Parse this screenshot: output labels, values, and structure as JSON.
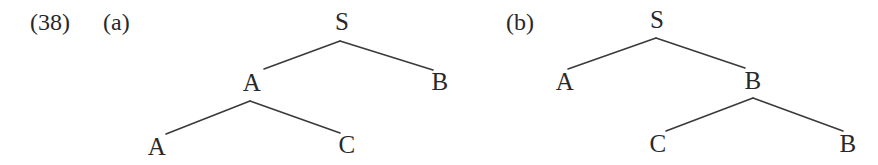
{
  "figure": {
    "example_number": "(38)",
    "example_number_pos": {
      "x": 30,
      "y": 10
    },
    "background_color": "#ffffff",
    "ink_color": "#28282b",
    "line_color": "#3a3a3a",
    "line_width": 1.6,
    "subfigures": [
      {
        "id": "a",
        "label": "(a)",
        "label_pos": {
          "x": 103,
          "y": 10
        },
        "nodes": [
          {
            "id": "a-root-s",
            "text": "S",
            "x": 342,
            "y": 21
          },
          {
            "id": "a-mid-a",
            "text": "A",
            "x": 252,
            "y": 82
          },
          {
            "id": "a-right-b",
            "text": "B",
            "x": 440,
            "y": 81
          },
          {
            "id": "a-leaf-a",
            "text": "A",
            "x": 157,
            "y": 146
          },
          {
            "id": "a-leaf-c",
            "text": "C",
            "x": 347,
            "y": 144
          }
        ],
        "edges": [
          {
            "from": "a-root-s",
            "to": "a-mid-a",
            "x1": 340,
            "y1": 41,
            "x2": 264,
            "y2": 69
          },
          {
            "from": "a-root-s",
            "to": "a-right-b",
            "x1": 340,
            "y1": 41,
            "x2": 433,
            "y2": 70
          },
          {
            "from": "a-mid-a",
            "to": "a-leaf-a",
            "x1": 250,
            "y1": 101,
            "x2": 166,
            "y2": 134
          },
          {
            "from": "a-mid-a",
            "to": "a-leaf-c",
            "x1": 250,
            "y1": 101,
            "x2": 340,
            "y2": 133
          }
        ]
      },
      {
        "id": "b",
        "label": "(b)",
        "label_pos": {
          "x": 506,
          "y": 10
        },
        "nodes": [
          {
            "id": "b-root-s",
            "text": "S",
            "x": 657,
            "y": 19
          },
          {
            "id": "b-left-a",
            "text": "A",
            "x": 565,
            "y": 81
          },
          {
            "id": "b-mid-b",
            "text": "B",
            "x": 753,
            "y": 80
          },
          {
            "id": "b-leaf-c",
            "text": "C",
            "x": 658,
            "y": 143
          },
          {
            "id": "b-leaf-b",
            "text": "B",
            "x": 848,
            "y": 143
          }
        ],
        "edges": [
          {
            "from": "b-root-s",
            "to": "b-left-a",
            "x1": 656,
            "y1": 38,
            "x2": 568,
            "y2": 69
          },
          {
            "from": "b-root-s",
            "to": "b-mid-b",
            "x1": 656,
            "y1": 38,
            "x2": 745,
            "y2": 68
          },
          {
            "from": "b-mid-b",
            "to": "b-leaf-c",
            "x1": 753,
            "y1": 98,
            "x2": 666,
            "y2": 131
          },
          {
            "from": "b-mid-b",
            "to": "b-leaf-b",
            "x1": 753,
            "y1": 98,
            "x2": 843,
            "y2": 131
          }
        ]
      }
    ]
  }
}
